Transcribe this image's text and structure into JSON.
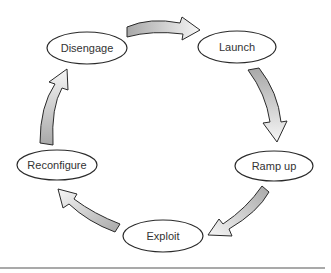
{
  "diagram": {
    "type": "cycle",
    "nodes": [
      {
        "id": "disengage",
        "label": "Disengage"
      },
      {
        "id": "launch",
        "label": "Launch"
      },
      {
        "id": "ramp_up",
        "label": "Ramp up"
      },
      {
        "id": "exploit",
        "label": "Exploit"
      },
      {
        "id": "reconfigure",
        "label": "Reconfigure"
      }
    ],
    "edges": [
      {
        "from": "Disengage",
        "to": "Launch"
      },
      {
        "from": "Launch",
        "to": "Ramp up"
      },
      {
        "from": "Ramp up",
        "to": "Exploit"
      },
      {
        "from": "Exploit",
        "to": "Reconfigure"
      },
      {
        "from": "Reconfigure",
        "to": "Disengage"
      }
    ],
    "colors": {
      "arrow_fill_light": "#f4f4f4",
      "arrow_fill_dark": "#a8a8a8",
      "outline": "#2a2a2a",
      "text": "#333333"
    }
  }
}
